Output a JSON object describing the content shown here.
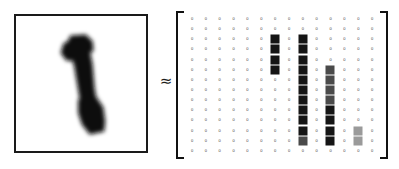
{
  "figure": {
    "relation_symbol": "≈",
    "image_panel": {
      "label": "handwritten-digit-image",
      "digit": "1",
      "background_color": "#ffffff",
      "ink_color": "#111111",
      "border_color": "#1a1a1a"
    },
    "matrix": {
      "rows": 14,
      "cols": 14,
      "zero_label": "0",
      "bracket_color": "#111111",
      "values": [
        [
          0,
          0,
          0,
          0,
          0,
          0,
          0,
          0,
          0,
          0,
          0,
          0,
          0,
          0
        ],
        [
          0,
          0,
          0,
          0,
          0,
          0,
          0,
          0,
          0,
          0,
          0,
          0,
          0,
          0
        ],
        [
          0,
          0,
          0,
          0,
          0,
          0,
          166,
          0,
          241,
          0,
          0,
          0,
          0,
          0
        ],
        [
          0,
          0,
          0,
          0,
          0,
          0,
          214,
          0,
          253,
          0,
          0,
          0,
          0,
          0
        ],
        [
          0,
          0,
          0,
          0,
          0,
          0,
          229,
          0,
          252,
          0,
          0,
          0,
          0,
          0
        ],
        [
          0,
          0,
          0,
          0,
          0,
          0,
          198,
          0,
          254,
          0,
          121,
          0,
          0,
          0
        ],
        [
          0,
          0,
          0,
          0,
          0,
          0,
          0,
          0,
          251,
          0,
          176,
          0,
          0,
          0
        ],
        [
          0,
          0,
          0,
          0,
          0,
          0,
          0,
          0,
          253,
          0,
          189,
          0,
          0,
          0
        ],
        [
          0,
          0,
          0,
          0,
          0,
          0,
          0,
          0,
          250,
          0,
          143,
          0,
          0,
          0
        ],
        [
          0,
          0,
          0,
          0,
          0,
          0,
          0,
          0,
          252,
          0,
          218,
          0,
          0,
          0
        ],
        [
          0,
          0,
          0,
          0,
          0,
          0,
          0,
          0,
          254,
          0,
          231,
          0,
          0,
          0
        ],
        [
          0,
          0,
          0,
          0,
          0,
          0,
          0,
          0,
          249,
          0,
          246,
          0,
          64,
          0
        ],
        [
          0,
          0,
          0,
          0,
          0,
          0,
          0,
          0,
          113,
          0,
          238,
          0,
          58,
          0
        ],
        [
          0,
          0,
          0,
          0,
          0,
          0,
          0,
          0,
          0,
          0,
          0,
          0,
          0,
          0
        ]
      ],
      "levels": [
        [
          "z",
          "z",
          "z",
          "z",
          "z",
          "z",
          "z",
          "z",
          "z",
          "z",
          "z",
          "z",
          "z",
          "z"
        ],
        [
          "z",
          "z",
          "z",
          "z",
          "z",
          "z",
          "z",
          "z",
          "z",
          "z",
          "z",
          "z",
          "z",
          "z"
        ],
        [
          "z",
          "z",
          "z",
          "z",
          "z",
          "z",
          "hi",
          "z",
          "hi",
          "z",
          "z",
          "z",
          "z",
          "z"
        ],
        [
          "z",
          "z",
          "z",
          "z",
          "z",
          "z",
          "hi",
          "z",
          "hi",
          "z",
          "z",
          "z",
          "z",
          "z"
        ],
        [
          "z",
          "z",
          "z",
          "z",
          "z",
          "z",
          "hi",
          "z",
          "hi",
          "z",
          "z",
          "z",
          "z",
          "z"
        ],
        [
          "z",
          "z",
          "z",
          "z",
          "z",
          "z",
          "hi",
          "z",
          "hi",
          "z",
          "mid",
          "z",
          "z",
          "z"
        ],
        [
          "z",
          "z",
          "z",
          "z",
          "z",
          "z",
          "z",
          "z",
          "hi",
          "z",
          "mid",
          "z",
          "z",
          "z"
        ],
        [
          "z",
          "z",
          "z",
          "z",
          "z",
          "z",
          "z",
          "z",
          "hi",
          "z",
          "mid",
          "z",
          "z",
          "z"
        ],
        [
          "z",
          "z",
          "z",
          "z",
          "z",
          "z",
          "z",
          "z",
          "hi",
          "z",
          "mid",
          "z",
          "z",
          "z"
        ],
        [
          "z",
          "z",
          "z",
          "z",
          "z",
          "z",
          "z",
          "z",
          "hi",
          "z",
          "hi",
          "z",
          "z",
          "z"
        ],
        [
          "z",
          "z",
          "z",
          "z",
          "z",
          "z",
          "z",
          "z",
          "hi",
          "z",
          "hi",
          "z",
          "z",
          "z"
        ],
        [
          "z",
          "z",
          "z",
          "z",
          "z",
          "z",
          "z",
          "z",
          "hi",
          "z",
          "hi",
          "z",
          "lo",
          "z"
        ],
        [
          "z",
          "z",
          "z",
          "z",
          "z",
          "z",
          "z",
          "z",
          "mid",
          "z",
          "hi",
          "z",
          "lo",
          "z"
        ],
        [
          "z",
          "z",
          "z",
          "z",
          "z",
          "z",
          "z",
          "z",
          "z",
          "z",
          "z",
          "z",
          "z",
          "z"
        ]
      ]
    }
  }
}
